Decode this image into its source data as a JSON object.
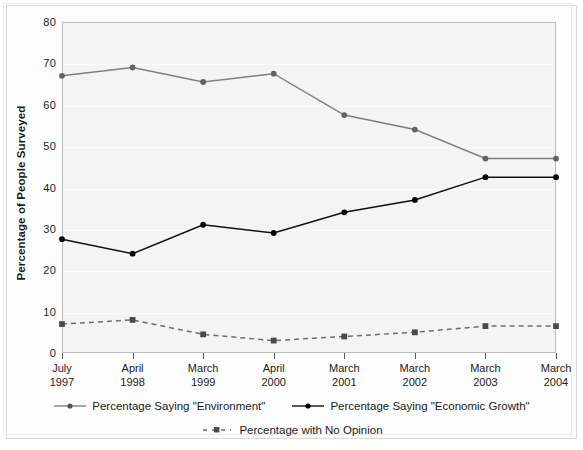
{
  "chart_data": {
    "type": "line",
    "title": "",
    "xlabel": "",
    "ylabel": "Percentage of People Surveyed",
    "ylim": [
      0,
      80
    ],
    "yticks": [
      0,
      10,
      20,
      30,
      40,
      50,
      60,
      70,
      80
    ],
    "grid": true,
    "legend_position": "bottom",
    "categories": [
      "July 1997",
      "April 1998",
      "March 1999",
      "April 2000",
      "March 2001",
      "March 2002",
      "March 2003",
      "March 2004"
    ],
    "category_lines": [
      {
        "month": "July",
        "year": "1997"
      },
      {
        "month": "April",
        "year": "1998"
      },
      {
        "month": "March",
        "year": "1999"
      },
      {
        "month": "April",
        "year": "2000"
      },
      {
        "month": "March",
        "year": "2001"
      },
      {
        "month": "March",
        "year": "2002"
      },
      {
        "month": "March",
        "year": "2003"
      },
      {
        "month": "March",
        "year": "2004"
      }
    ],
    "series": [
      {
        "name": "Percentage Saying \"Environment\"",
        "color": "#7f7f7f",
        "marker": "circle",
        "dash": "solid",
        "values": [
          67,
          69,
          65.5,
          67.5,
          57.5,
          54,
          47,
          47
        ]
      },
      {
        "name": "Percentage Saying \"Economic Growth\"",
        "color": "#111111",
        "marker": "circle",
        "dash": "solid",
        "values": [
          27.5,
          24,
          31,
          29,
          34,
          37,
          42.5,
          42.5
        ]
      },
      {
        "name": "Percentage with No Opinion",
        "color": "#6e6e6e",
        "marker": "square",
        "dash": "dashed",
        "values": [
          7,
          8,
          4.5,
          3,
          4,
          5,
          6.5,
          6.5
        ]
      }
    ]
  },
  "axis": {
    "y_title": "Percentage of People Surveyed",
    "y_tick_labels": [
      "80",
      "70",
      "60",
      "50",
      "40",
      "30",
      "20",
      "10",
      "0"
    ]
  },
  "legend": {
    "row1": [
      {
        "label": "Percentage Saying \"Environment\""
      },
      {
        "label": "Percentage Saying \"Economic Growth\""
      }
    ],
    "row2": [
      {
        "label": "Percentage with No Opinion"
      }
    ]
  }
}
